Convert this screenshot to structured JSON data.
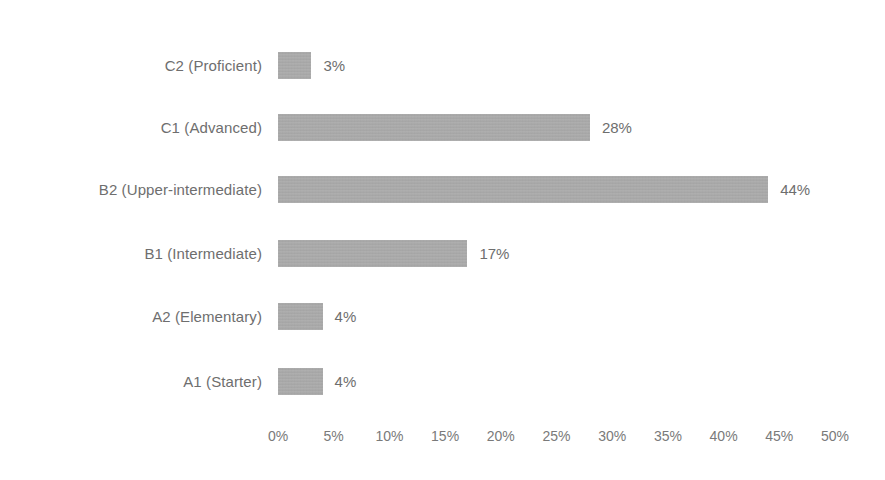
{
  "chart_data": {
    "type": "bar",
    "orientation": "horizontal",
    "title": "",
    "subtitle": "",
    "xlabel": "",
    "ylabel": "",
    "categories": [
      "C2 (Proficient)",
      "C1 (Advanced)",
      "B2 (Upper-intermediate)",
      "B1 (Intermediate)",
      "A2 (Elementary)",
      "A1 (Starter)"
    ],
    "values": [
      3,
      28,
      44,
      17,
      4,
      4
    ],
    "value_labels": [
      "3%",
      "28%",
      "44%",
      "17%",
      "4%",
      "4%"
    ],
    "xlim": [
      0,
      50
    ],
    "xticks": [
      0,
      5,
      10,
      15,
      20,
      25,
      30,
      35,
      40,
      45,
      50
    ],
    "xtick_labels": [
      "0%",
      "5%",
      "10%",
      "15%",
      "20%",
      "25%",
      "30%",
      "35%",
      "40%",
      "45%",
      "50%"
    ],
    "grid": false,
    "legend": false,
    "legend_position": "none",
    "bar_color": "#a9a9a9",
    "text_color": "#6e6e6e",
    "background_color": "#ffffff"
  },
  "rows": [
    {
      "label": "C2 (Proficient)",
      "value": 3,
      "value_label": "3%"
    },
    {
      "label": "C1 (Advanced)",
      "value": 28,
      "value_label": "28%"
    },
    {
      "label": "B2 (Upper-intermediate)",
      "value": 44,
      "value_label": "44%"
    },
    {
      "label": "B1 (Intermediate)",
      "value": 17,
      "value_label": "17%"
    },
    {
      "label": "A2 (Elementary)",
      "value": 4,
      "value_label": "4%"
    },
    {
      "label": "A1 (Starter)",
      "value": 4,
      "value_label": "4%"
    }
  ],
  "axis": {
    "ticks": [
      "0%",
      "5%",
      "10%",
      "15%",
      "20%",
      "25%",
      "30%",
      "35%",
      "40%",
      "45%",
      "50%"
    ]
  }
}
